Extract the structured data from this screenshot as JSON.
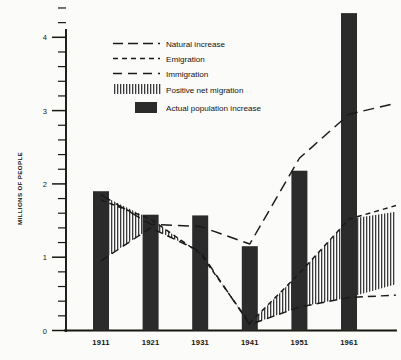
{
  "chart_data": {
    "type": "bar",
    "title": "",
    "subtitle": "",
    "xlabel": "",
    "ylabel": "MILLIONS  OF  PEOPLE",
    "categories": [
      "1911",
      "1921",
      "1931",
      "1941",
      "1951",
      "1961"
    ],
    "ylim": [
      0,
      4.4
    ],
    "yticks": [
      0,
      1,
      2,
      3,
      4
    ],
    "ytick_labels": [
      "0",
      "1",
      "2",
      "3",
      "4"
    ],
    "minor_tick_step": 0.2,
    "grid": false,
    "legend_position": "upper-center-left",
    "series": [
      {
        "name": "Actual population increase",
        "type": "bar",
        "style": "solid-fill",
        "color": "#2b2b2b",
        "values": [
          1.9,
          1.58,
          1.57,
          1.15,
          2.18,
          4.33
        ]
      },
      {
        "name": "Natural increase",
        "type": "line",
        "style": "long-dash",
        "color": "#1a1a1a",
        "x": [
          "1911",
          "1921",
          "1931",
          "1941",
          "1951",
          "1961"
        ],
        "values": [
          1.85,
          1.45,
          1.42,
          1.18,
          2.35,
          2.95
        ]
      },
      {
        "name": "Emigration",
        "type": "line",
        "style": "short-dash",
        "color": "#1a1a1a",
        "x": [
          "1911",
          "1921",
          "1931",
          "1941",
          "1951",
          "1961"
        ],
        "values": [
          1.78,
          1.52,
          1.05,
          0.1,
          0.78,
          1.52
        ]
      },
      {
        "name": "Immigration",
        "type": "line",
        "style": "medium-dash",
        "color": "#1a1a1a",
        "x": [
          "1911",
          "1921",
          "1931",
          "1941",
          "1951",
          "1961"
        ],
        "values": [
          0.95,
          1.4,
          1.08,
          0.08,
          0.32,
          0.45
        ]
      },
      {
        "name": "Positive net migration",
        "type": "area-band",
        "style": "vertical-hatch",
        "color": "#1a1a1a",
        "x": [
          "1911",
          "1921",
          "1931",
          "1941",
          "1951",
          "1961"
        ],
        "upper": [
          1.85,
          1.52,
          1.05,
          0.1,
          0.78,
          1.52
        ],
        "lower": [
          0.95,
          1.4,
          1.08,
          0.08,
          0.32,
          0.45
        ]
      }
    ]
  },
  "legend": {
    "items": [
      {
        "label": "Natural increase",
        "swatch": "long-dash-line"
      },
      {
        "label": "Emigration",
        "swatch": "short-dash-line"
      },
      {
        "label": "Immigration",
        "swatch": "medium-dash-line"
      },
      {
        "label": "Positive net migration",
        "swatch": "vertical-hatch-block"
      },
      {
        "label": "Actual population increase",
        "swatch": "solid-black-block"
      }
    ]
  }
}
